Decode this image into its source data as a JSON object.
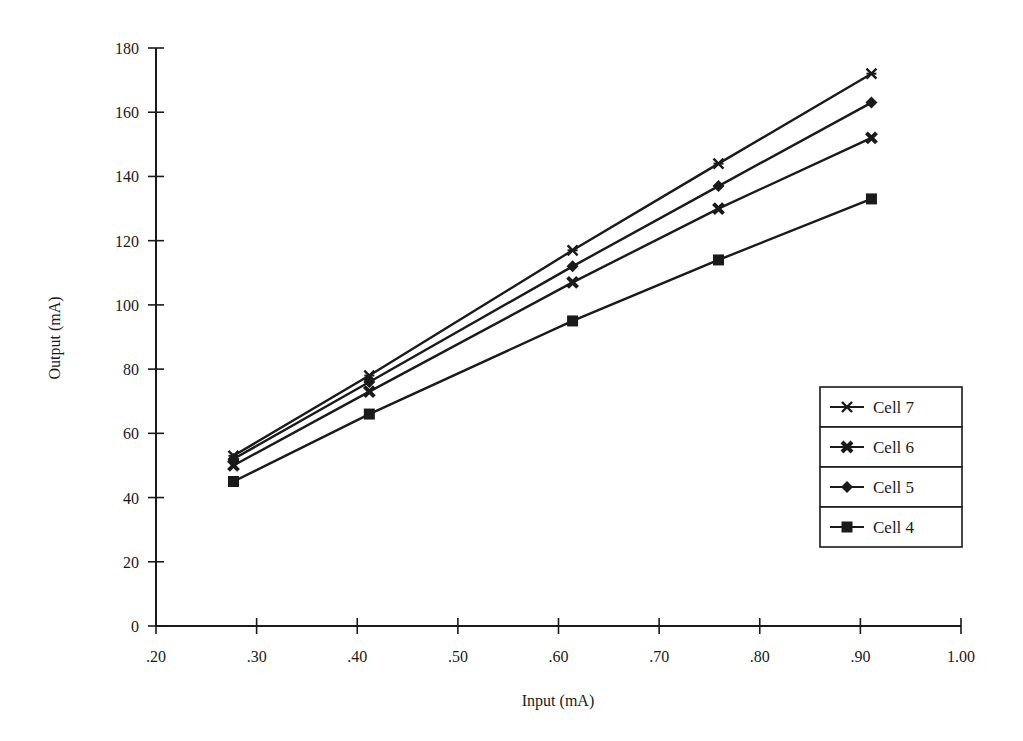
{
  "chart_data": {
    "type": "line",
    "title": "",
    "xlabel": "Input (mA)",
    "ylabel": "Output (mA)",
    "xlim": [
      0.2,
      1.0
    ],
    "ylim": [
      0,
      180
    ],
    "x_ticks": [
      0.2,
      0.3,
      0.4,
      0.5,
      0.6,
      0.7,
      0.8,
      0.9,
      1.0
    ],
    "x_tick_labels": [
      ".20",
      ".30",
      ".40",
      ".50",
      ".60",
      ".70",
      ".80",
      ".90",
      "1.00"
    ],
    "y_ticks": [
      0,
      20,
      40,
      60,
      80,
      100,
      120,
      140,
      160,
      180
    ],
    "y_tick_labels": [
      "0",
      "20",
      "40",
      "60",
      "80",
      "100",
      "120",
      "140",
      "160",
      "180"
    ],
    "grid": false,
    "legend_position": "right-center (boxed, stacked entries)",
    "x": [
      0.277,
      0.412,
      0.614,
      0.759,
      0.911
    ],
    "series": [
      {
        "name": "Cell 7",
        "marker": "asterisk",
        "values": [
          53,
          78,
          117,
          144,
          172
        ]
      },
      {
        "name": "Cell 6",
        "marker": "x-bold",
        "values": [
          50,
          73,
          107,
          130,
          152
        ]
      },
      {
        "name": "Cell 5",
        "marker": "diamond",
        "values": [
          52,
          76,
          112,
          137,
          163
        ]
      },
      {
        "name": "Cell 4",
        "marker": "square",
        "values": [
          45,
          66,
          95,
          114,
          133
        ]
      }
    ]
  },
  "legend": {
    "items": [
      {
        "label": "Cell 7",
        "marker": "asterisk"
      },
      {
        "label": "Cell 6",
        "marker": "x-bold"
      },
      {
        "label": "Cell 5",
        "marker": "diamond"
      },
      {
        "label": "Cell 4",
        "marker": "square"
      }
    ]
  },
  "colors": {
    "ink": "#1a1a1a",
    "background": "#ffffff"
  }
}
